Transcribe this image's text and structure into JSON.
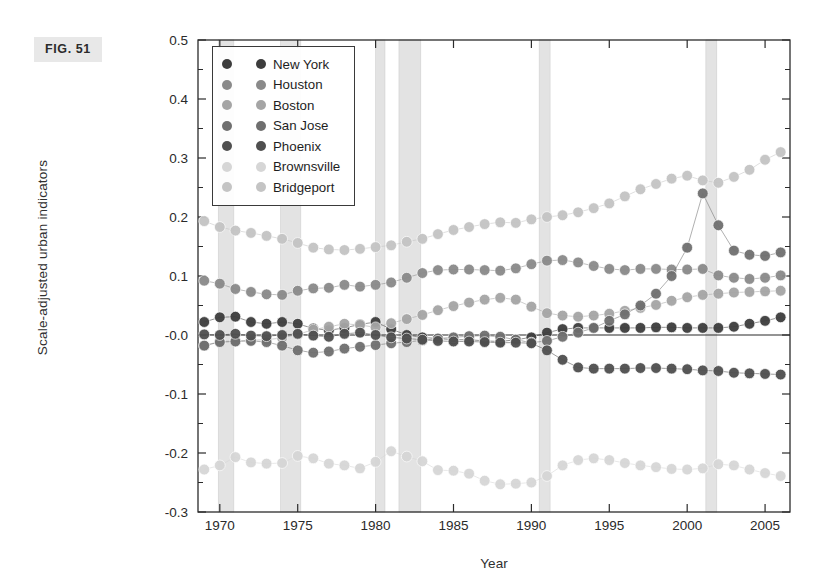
{
  "figure": {
    "tag": "FIG. 51"
  },
  "chart_data": {
    "type": "line",
    "title": "",
    "xlabel": "Year",
    "ylabel": "Scale-adjusted urban indicators",
    "xlim": [
      1968.6,
      2006.6
    ],
    "ylim": [
      -0.3,
      0.5
    ],
    "xticks": [
      1970,
      1975,
      1980,
      1985,
      1990,
      1995,
      2000,
      2005
    ],
    "yticks": [
      0.5,
      0.4,
      0.3,
      0.2,
      0.1,
      -0.0,
      -0.1,
      -0.2,
      -0.3
    ],
    "ytick_labels": [
      "0.5",
      "0.4",
      "0.3",
      "0.2",
      "0.1",
      "-0.0",
      "-0.1",
      "-0.2",
      "-0.3"
    ],
    "xtick_labels": [
      "1970",
      "1975",
      "1980",
      "1985",
      "1990",
      "1995",
      "2000",
      "2005"
    ],
    "grid": false,
    "legend_position": "upper-left",
    "zero_line": 0.0,
    "marker": "circle",
    "shaded_bands_label": "recession-band",
    "shaded_bands": [
      [
        1969.9,
        1970.9
      ],
      [
        1973.9,
        1975.2
      ],
      [
        1980.0,
        1980.6
      ],
      [
        1981.5,
        1982.9
      ],
      [
        1990.5,
        1991.2
      ],
      [
        2001.2,
        2001.9
      ]
    ],
    "x": [
      1969,
      1970,
      1971,
      1972,
      1973,
      1974,
      1975,
      1976,
      1977,
      1978,
      1979,
      1980,
      1981,
      1982,
      1983,
      1984,
      1985,
      1986,
      1987,
      1988,
      1989,
      1990,
      1991,
      1992,
      1993,
      1994,
      1995,
      1996,
      1997,
      1998,
      1999,
      2000,
      2001,
      2002,
      2003,
      2004,
      2005,
      2006
    ],
    "series": [
      {
        "name": "New York",
        "color": "#3d3d3d",
        "values": [
          0.022,
          0.03,
          0.031,
          0.022,
          0.019,
          0.022,
          0.019,
          0.011,
          0.008,
          0.012,
          0.018,
          0.022,
          0.01,
          0.0,
          -0.004,
          -0.006,
          -0.008,
          -0.008,
          -0.01,
          -0.011,
          -0.008,
          -0.004,
          0.004,
          0.01,
          0.012,
          0.012,
          0.012,
          0.012,
          0.012,
          0.013,
          0.013,
          0.012,
          0.012,
          0.012,
          0.014,
          0.019,
          0.024,
          0.03
        ]
      },
      {
        "name": "Houston",
        "color": "#8a8a8a",
        "values": [
          0.092,
          0.087,
          0.078,
          0.073,
          0.069,
          0.068,
          0.075,
          0.079,
          0.08,
          0.085,
          0.082,
          0.085,
          0.089,
          0.097,
          0.105,
          0.11,
          0.111,
          0.111,
          0.11,
          0.109,
          0.113,
          0.12,
          0.126,
          0.127,
          0.123,
          0.117,
          0.112,
          0.11,
          0.112,
          0.112,
          0.111,
          0.111,
          0.112,
          0.101,
          0.097,
          0.095,
          0.097,
          0.101
        ]
      },
      {
        "name": "Boston",
        "color": "#a5a5a5",
        "values": [
          -0.018,
          -0.011,
          -0.01,
          -0.009,
          -0.008,
          -0.005,
          0.001,
          0.009,
          0.014,
          0.019,
          0.017,
          0.013,
          0.02,
          0.027,
          0.034,
          0.042,
          0.049,
          0.055,
          0.06,
          0.063,
          0.06,
          0.048,
          0.037,
          0.033,
          0.031,
          0.033,
          0.036,
          0.041,
          0.046,
          0.051,
          0.058,
          0.064,
          0.068,
          0.07,
          0.072,
          0.073,
          0.074,
          0.075
        ]
      },
      {
        "name": "San Jose",
        "color": "#6f6f6f",
        "values": [
          -0.018,
          -0.012,
          -0.011,
          -0.01,
          -0.012,
          -0.018,
          -0.026,
          -0.03,
          -0.028,
          -0.023,
          -0.02,
          -0.017,
          -0.014,
          -0.012,
          -0.009,
          -0.006,
          -0.004,
          -0.002,
          -0.001,
          -0.003,
          -0.008,
          -0.013,
          -0.01,
          -0.003,
          0.004,
          0.012,
          0.024,
          0.035,
          0.05,
          0.07,
          0.1,
          0.148,
          0.24,
          0.186,
          0.143,
          0.136,
          0.134,
          0.14
        ]
      },
      {
        "name": "Phoenix",
        "color": "#4f4f4f",
        "values": [
          0.001,
          0.0,
          0.002,
          -0.001,
          -0.002,
          0.0,
          0.002,
          -0.001,
          -0.003,
          0.002,
          0.004,
          0.0,
          -0.004,
          -0.006,
          -0.008,
          -0.01,
          -0.011,
          -0.011,
          -0.012,
          -0.013,
          -0.013,
          -0.014,
          -0.026,
          -0.042,
          -0.055,
          -0.057,
          -0.057,
          -0.057,
          -0.056,
          -0.056,
          -0.057,
          -0.058,
          -0.06,
          -0.061,
          -0.064,
          -0.065,
          -0.066,
          -0.067
        ]
      },
      {
        "name": "Brownsville",
        "color": "#d6d6d6",
        "values": [
          -0.228,
          -0.221,
          -0.207,
          -0.216,
          -0.218,
          -0.217,
          -0.205,
          -0.209,
          -0.218,
          -0.221,
          -0.226,
          -0.215,
          -0.197,
          -0.206,
          -0.214,
          -0.229,
          -0.23,
          -0.235,
          -0.247,
          -0.253,
          -0.252,
          -0.25,
          -0.239,
          -0.221,
          -0.212,
          -0.209,
          -0.212,
          -0.217,
          -0.221,
          -0.224,
          -0.227,
          -0.228,
          -0.226,
          -0.219,
          -0.221,
          -0.228,
          -0.234,
          -0.239
        ]
      },
      {
        "name": "Bridgeport",
        "color": "#c4c4c4",
        "values": [
          0.193,
          0.183,
          0.177,
          0.173,
          0.168,
          0.163,
          0.156,
          0.148,
          0.145,
          0.144,
          0.146,
          0.149,
          0.152,
          0.158,
          0.163,
          0.171,
          0.178,
          0.183,
          0.188,
          0.191,
          0.19,
          0.196,
          0.2,
          0.203,
          0.208,
          0.215,
          0.223,
          0.235,
          0.247,
          0.256,
          0.265,
          0.27,
          0.262,
          0.258,
          0.268,
          0.28,
          0.297,
          0.31
        ]
      }
    ]
  }
}
